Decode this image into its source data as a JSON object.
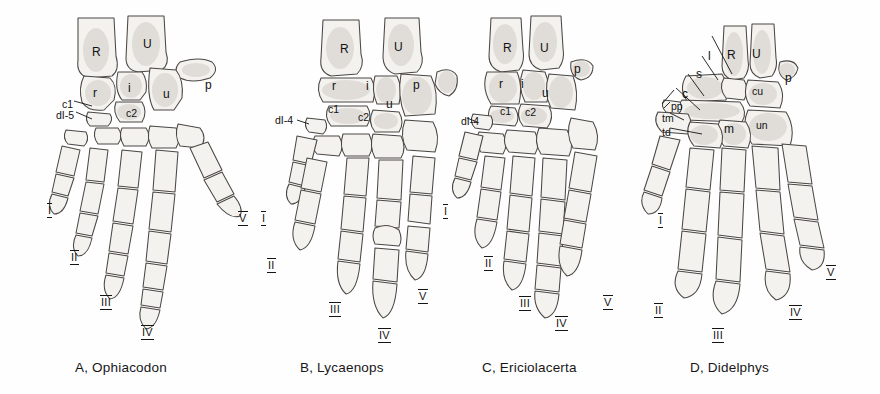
{
  "plate": {
    "title": "Comparative manus (hand) skeletons",
    "background_color": "#fefefe",
    "ink_color": "#1a1a1a",
    "bone_fill_color": "#f4f2ef"
  },
  "panels": [
    {
      "id": "A",
      "caption": "A, Ophiacodon",
      "labels": [
        {
          "text": "R",
          "x": 92,
          "y": 46
        },
        {
          "text": "U",
          "x": 143,
          "y": 38
        },
        {
          "text": "p",
          "x": 205,
          "y": 79
        },
        {
          "text": "r",
          "x": 93,
          "y": 87
        },
        {
          "text": "i",
          "x": 128,
          "y": 82
        },
        {
          "text": "u",
          "x": 163,
          "y": 88
        },
        {
          "text": "c2",
          "x": 126,
          "y": 108
        },
        {
          "text": "c1",
          "x": 62,
          "y": 99
        },
        {
          "text": "dI-5",
          "x": 56,
          "y": 110
        }
      ],
      "digits": [
        {
          "text": "I",
          "x": 48,
          "y": 205
        },
        {
          "text": "II",
          "x": 71,
          "y": 252
        },
        {
          "text": "III",
          "x": 101,
          "y": 297
        },
        {
          "text": "IV",
          "x": 142,
          "y": 327
        },
        {
          "text": "V",
          "x": 239,
          "y": 213
        }
      ]
    },
    {
      "id": "B",
      "caption": "B, Lycaenops",
      "labels": [
        {
          "text": "R",
          "x": 340,
          "y": 43
        },
        {
          "text": "U",
          "x": 394,
          "y": 41
        },
        {
          "text": "r",
          "x": 332,
          "y": 80
        },
        {
          "text": "i",
          "x": 366,
          "y": 80
        },
        {
          "text": "u",
          "x": 386,
          "y": 98
        },
        {
          "text": "p",
          "x": 413,
          "y": 79
        },
        {
          "text": "c1",
          "x": 328,
          "y": 104
        },
        {
          "text": "c2",
          "x": 358,
          "y": 112
        },
        {
          "text": "dI-4",
          "x": 275,
          "y": 115
        }
      ],
      "digits": [
        {
          "text": "I",
          "x": 262,
          "y": 213
        },
        {
          "text": "II",
          "x": 268,
          "y": 260
        },
        {
          "text": "III",
          "x": 330,
          "y": 304
        },
        {
          "text": "IV",
          "x": 379,
          "y": 330
        },
        {
          "text": "V",
          "x": 419,
          "y": 291
        }
      ]
    },
    {
      "id": "C",
      "caption": "C, Ericiolacerta",
      "labels": [
        {
          "text": "R",
          "x": 503,
          "y": 42
        },
        {
          "text": "U",
          "x": 540,
          "y": 42
        },
        {
          "text": "p",
          "x": 574,
          "y": 63
        },
        {
          "text": "r",
          "x": 499,
          "y": 78
        },
        {
          "text": "i",
          "x": 521,
          "y": 78
        },
        {
          "text": "u",
          "x": 542,
          "y": 87
        },
        {
          "text": "c1",
          "x": 500,
          "y": 106
        },
        {
          "text": "c2",
          "x": 525,
          "y": 107
        },
        {
          "text": "dI-4",
          "x": 461,
          "y": 116
        }
      ],
      "digits": [
        {
          "text": "I",
          "x": 444,
          "y": 206
        },
        {
          "text": "II",
          "x": 485,
          "y": 258
        },
        {
          "text": "III",
          "x": 520,
          "y": 298
        },
        {
          "text": "IV",
          "x": 556,
          "y": 318
        },
        {
          "text": "V",
          "x": 604,
          "y": 297
        }
      ]
    },
    {
      "id": "D",
      "caption": "D, Didelphys",
      "labels": [
        {
          "text": "l",
          "x": 708,
          "y": 50
        },
        {
          "text": "R",
          "x": 727,
          "y": 49
        },
        {
          "text": "U",
          "x": 752,
          "y": 48
        },
        {
          "text": "p",
          "x": 785,
          "y": 72
        },
        {
          "text": "s",
          "x": 696,
          "y": 68
        },
        {
          "text": "cu",
          "x": 752,
          "y": 86
        },
        {
          "text": "c",
          "x": 682,
          "y": 88
        },
        {
          "text": "pp",
          "x": 671,
          "y": 101
        },
        {
          "text": "tm",
          "x": 662,
          "y": 113
        },
        {
          "text": "un",
          "x": 756,
          "y": 120
        },
        {
          "text": "td",
          "x": 662,
          "y": 127
        },
        {
          "text": "m",
          "x": 724,
          "y": 123
        }
      ],
      "digits": [
        {
          "text": "I",
          "x": 659,
          "y": 215
        },
        {
          "text": "II",
          "x": 655,
          "y": 305
        },
        {
          "text": "III",
          "x": 713,
          "y": 330
        },
        {
          "text": "IV",
          "x": 790,
          "y": 307
        },
        {
          "text": "V",
          "x": 827,
          "y": 267
        }
      ]
    }
  ],
  "captions_y": 360
}
